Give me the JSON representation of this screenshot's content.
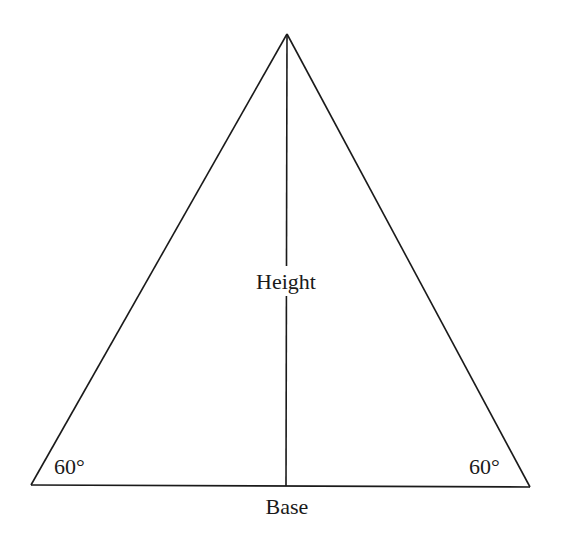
{
  "diagram": {
    "type": "equilateral-triangle",
    "vertices": {
      "apex": [
        287,
        34
      ],
      "bottom_left": [
        31,
        485
      ],
      "bottom_right": [
        530,
        487
      ]
    },
    "height_line": {
      "from": [
        287,
        34
      ],
      "to": [
        286,
        486
      ]
    },
    "labels": {
      "height": "Height",
      "base": "Base",
      "angle_left": "60°",
      "angle_right": "60°"
    },
    "stroke_color": "#1a1a1a"
  }
}
